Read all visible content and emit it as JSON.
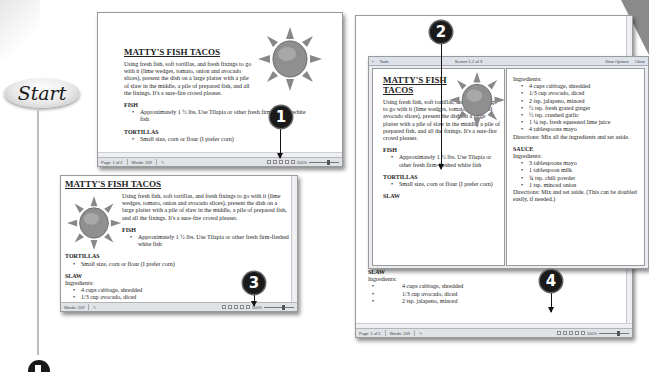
{
  "decor": {
    "start_label": "Start"
  },
  "recipe": {
    "title": "MATTY'S FISH TACOS",
    "title_line1": "MATTY'S FISH",
    "title_line2": "TACOS",
    "intro": "Using fresh fish, soft tortillas, and fresh fixings to go with it (lime wedges, tomato, onion and avocado slices), present the dish on a large platter with a pile of slaw in the middle, a pile of prepared fish, and all the fixings. It's a sure-fire crowd pleaser.",
    "fish_heading": "FISH",
    "fish_item": "Approximately 1 ½ lbs. Use Tilapia or other fresh firm-fleshed white fish",
    "tortillas_heading": "TORTILLAS",
    "tortillas_item": "Small size, corn or flour (I prefer corn)",
    "slaw_heading": "SLAW",
    "ingredients_label": "Ingredients:",
    "slaw_items": [
      "4 cups cabbage, shredded",
      "1/3 cup avocado, diced",
      "2 tsp. jalapeno, minced",
      "½ tsp. fresh grated ginger",
      "½ tsp. crushed garlic",
      "1 ¼ tsp. fresh squeezed lime juice",
      "4 tablespoons mayo"
    ],
    "slaw_directions": "Directions: Mix all the ingredients and set aside.",
    "sauce_heading": "SAUCE",
    "sauce_items": [
      "3 tablespoons mayo",
      "1 tablespoon milk",
      "¾ tsp. chili powder",
      "1 tsp. minced onion"
    ],
    "sauce_directions": "Directions: Mix and set aside. (This can be doubled easily, if needed.)"
  },
  "statusbar": {
    "page": "Page: 1 of 2",
    "words": "Words: 209",
    "zoom": "100%"
  },
  "reading_toolbar": {
    "tools": "Tools",
    "screens": "Screen 1-2 of 3",
    "view_options": "View Options",
    "close": "Close"
  },
  "callouts": [
    "1",
    "2",
    "3",
    "4"
  ]
}
